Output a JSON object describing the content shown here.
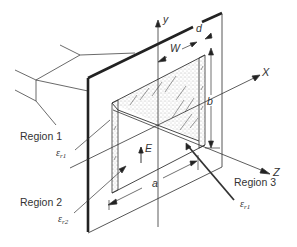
{
  "figure": {
    "axes": {
      "x_label": "X",
      "y_label": "y",
      "z_label": "Z"
    },
    "dimensions": {
      "width_label": "W",
      "thickness_label": "d",
      "height_label": "b",
      "length_label": "a"
    },
    "field": {
      "label": "E"
    },
    "regions": [
      {
        "label": "Region 1",
        "permittivity": "ε",
        "subscript": "r1"
      },
      {
        "label": "Region 2",
        "permittivity": "ε",
        "subscript": "r2"
      },
      {
        "label": "Region 3",
        "permittivity": "ε",
        "subscript": "r1"
      }
    ],
    "colors": {
      "line": "#333333",
      "stipple": "#555555",
      "background": "#ffffff"
    }
  }
}
